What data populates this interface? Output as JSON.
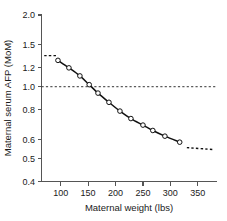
{
  "chart_data": {
    "type": "line",
    "title": "",
    "xlabel": "Maternal weight (lbs)",
    "ylabel": "Maternal serum AFP (MoM)",
    "xlim": [
      65,
      385
    ],
    "ylim": [
      0.4,
      2.0
    ],
    "yscale": "log",
    "grid": false,
    "legend": null,
    "xticks": [
      100,
      150,
      200,
      250,
      300,
      350
    ],
    "xtick_labels": [
      "100",
      "150",
      "200",
      "250",
      "300",
      "350"
    ],
    "yticks": [
      2.0,
      1.5,
      1.2,
      1.0,
      0.8,
      0.6,
      0.5,
      0.4
    ],
    "ytick_labels": [
      "2.0",
      "1.5",
      "1.2",
      "1.0",
      "0.8",
      "0.6",
      "0.5",
      "0.4"
    ],
    "series": [
      {
        "name": "Median maternal serum AFP by weight",
        "marker": "open-circle",
        "line": "solid",
        "x": [
          95,
          115,
          135,
          152,
          168,
          188,
          208,
          228,
          250,
          268,
          290,
          317
        ],
        "values": [
          1.29,
          1.2,
          1.11,
          1.02,
          0.94,
          0.86,
          0.79,
          0.735,
          0.69,
          0.655,
          0.62,
          0.585
        ]
      }
    ],
    "extensions": [
      {
        "name": "low-weight plateau",
        "line": "dashed",
        "x": [
          70,
          92
        ],
        "values": [
          1.35,
          1.35
        ]
      },
      {
        "name": "high-weight plateau",
        "line": "dashed",
        "x": [
          330,
          378
        ],
        "values": [
          0.555,
          0.545
        ]
      }
    ],
    "reference_lines": [
      {
        "name": "unity-mom-line",
        "orientation": "horizontal",
        "value": 1.0,
        "style": "dashed",
        "x_range": [
          65,
          385
        ]
      }
    ]
  }
}
